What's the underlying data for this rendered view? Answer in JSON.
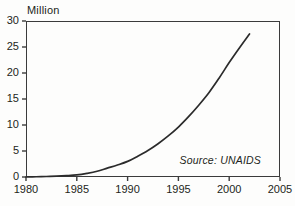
{
  "chart_data": {
    "type": "line",
    "title": "",
    "ylabel": "Million",
    "xlabel": "",
    "xlim": [
      1980,
      2005
    ],
    "ylim": [
      0,
      30
    ],
    "grid": false,
    "legend": "none",
    "annotation": "Source: UNAIDS",
    "yticks": [
      "30",
      "25",
      "20",
      "15",
      "10",
      "5",
      "0"
    ],
    "ytick_values": [
      30,
      25,
      20,
      15,
      10,
      5,
      0
    ],
    "xticks": [
      "1980",
      "1985",
      "1990",
      "1995",
      "2000",
      "2005"
    ],
    "xtick_values": [
      1980,
      1985,
      1990,
      1995,
      2000,
      2005
    ],
    "series": [
      {
        "name": "People living with HIV/AIDS",
        "x": [
          1980,
          1981,
          1982,
          1983,
          1984,
          1985,
          1986,
          1987,
          1988,
          1989,
          1990,
          1991,
          1992,
          1993,
          1994,
          1995,
          1996,
          1997,
          1998,
          1999,
          2000,
          2001,
          2002
        ],
        "values": [
          0.0,
          0.05,
          0.1,
          0.15,
          0.25,
          0.4,
          0.7,
          1.1,
          1.7,
          2.3,
          3.0,
          4.0,
          5.1,
          6.4,
          7.9,
          9.6,
          11.6,
          13.8,
          16.2,
          19.0,
          22.0,
          24.8,
          27.5
        ]
      }
    ]
  },
  "axis_title": "Million",
  "source_note": "Source: UNAIDS",
  "colors": {
    "frame": "#3b3b3b",
    "curve": "#2b2b2b",
    "text": "#231f20",
    "background": "#fdfdfc"
  }
}
